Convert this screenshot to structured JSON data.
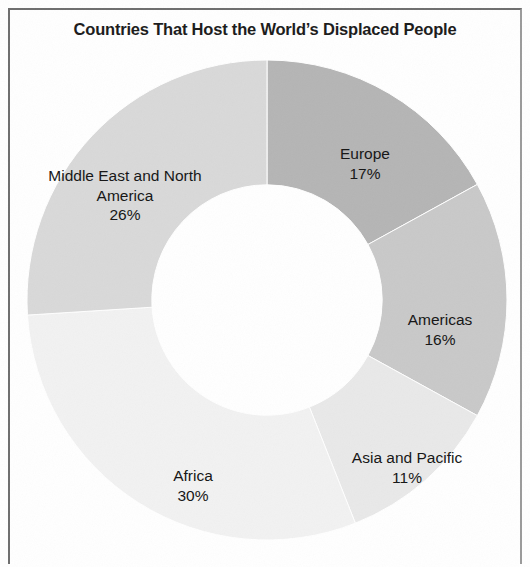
{
  "figure": {
    "background_color": "#ffffff",
    "frame_color": "#6e6e6e",
    "title": "Countries That Host the World’s Displaced People"
  },
  "chart_data": {
    "type": "pie",
    "variant": "donut",
    "title": "Countries That Host the World’s Displaced People",
    "subtitle": "",
    "xlabel": "",
    "ylabel": "",
    "legend_position": "none",
    "labels_position": "inside-slice",
    "value_unit": "percent",
    "value_suffix": "%",
    "total": 100,
    "start_angle_deg": 0,
    "direction": "clockwise",
    "inner_radius_ratio": 0.48,
    "categories": [
      "Europe",
      "Americas",
      "Asia and Pacific",
      "Africa",
      "Middle East and North America"
    ],
    "values": [
      17,
      16,
      11,
      30,
      26
    ],
    "colors": [
      "#b5b5b5",
      "#c9c9c9",
      "#e9e9e9",
      "#f2f2f2",
      "#d9d9d9"
    ],
    "slices": [
      {
        "name": "Europe",
        "label": "Europe",
        "value": 17,
        "value_text": "17%",
        "color": "#b5b5b5",
        "start_deg": 0,
        "end_deg": 61.2
      },
      {
        "name": "Americas",
        "label": "Americas",
        "value": 16,
        "value_text": "16%",
        "color": "#c9c9c9",
        "start_deg": 61.2,
        "end_deg": 118.8
      },
      {
        "name": "Asia and Pacific",
        "label": "Asia and Pacific",
        "value": 11,
        "value_text": "11%",
        "color": "#e9e9e9",
        "start_deg": 118.8,
        "end_deg": 158.4
      },
      {
        "name": "Africa",
        "label": "Africa",
        "value": 30,
        "value_text": "30%",
        "color": "#f2f2f2",
        "start_deg": 158.4,
        "end_deg": 266.4
      },
      {
        "name": "Middle East and North America",
        "label": "Middle East and North America",
        "value": 26,
        "value_text": "26%",
        "color": "#d9d9d9",
        "start_deg": 266.4,
        "end_deg": 360
      }
    ]
  },
  "labels": {
    "europe": {
      "name": "Europe",
      "pct": "17%"
    },
    "americas": {
      "name": "Americas",
      "pct": "16%"
    },
    "asia": {
      "name": "Asia and Pacific",
      "pct": "11%"
    },
    "africa": {
      "name": "Africa",
      "pct": "30%"
    },
    "mena": {
      "name": "Middle East and North\nAmerica",
      "pct": "26%"
    }
  }
}
